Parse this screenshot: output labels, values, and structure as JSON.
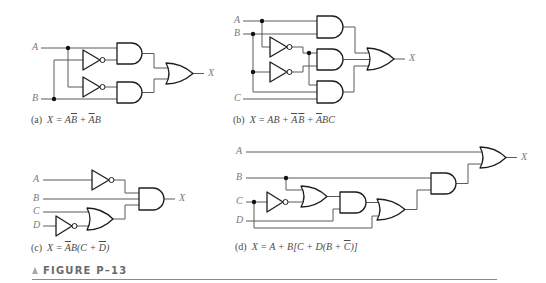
{
  "figure": {
    "label": "FIGURE P–13",
    "colors": {
      "wire": "#5a5a5a",
      "gate_outline": "#1e1e1e",
      "signal_label": "#7a7a7a",
      "caption": "#4a4a4a",
      "figure_label": "#6a6a6a"
    }
  },
  "panels": [
    {
      "id": "a",
      "inputs": [
        "A",
        "B"
      ],
      "output": "X",
      "caption": {
        "tag": "(a)",
        "parts": [
          {
            "t": "X = A",
            "overline": false
          },
          {
            "t": "B",
            "overline": true
          },
          {
            "t": " + ",
            "overline": false
          },
          {
            "t": "A",
            "overline": true
          },
          {
            "t": "B",
            "overline": false
          }
        ]
      }
    },
    {
      "id": "b",
      "inputs": [
        "A",
        "B",
        "C"
      ],
      "output": "X",
      "caption": {
        "tag": "(b)",
        "parts": [
          {
            "t": "X = AB + ",
            "overline": false
          },
          {
            "t": "A",
            "overline": true
          },
          {
            "t": "B",
            "overline": true
          },
          {
            "t": " + ",
            "overline": false
          },
          {
            "t": "A",
            "overline": true
          },
          {
            "t": "BC",
            "overline": false
          }
        ]
      }
    },
    {
      "id": "c",
      "inputs": [
        "A",
        "B",
        "C",
        "D"
      ],
      "output": "X",
      "caption": {
        "tag": "(c)",
        "parts": [
          {
            "t": "X = ",
            "overline": false
          },
          {
            "t": "A",
            "overline": true
          },
          {
            "t": "B(C + ",
            "overline": false
          },
          {
            "t": "D",
            "overline": true
          },
          {
            "t": ")",
            "overline": false
          }
        ]
      }
    },
    {
      "id": "d",
      "inputs": [
        "A",
        "B",
        "C",
        "D"
      ],
      "output": "X",
      "caption": {
        "tag": "(d)",
        "parts": [
          {
            "t": "X = A + B[C + D(B + ",
            "overline": false
          },
          {
            "t": "C",
            "overline": true
          },
          {
            "t": ")]",
            "overline": false
          }
        ]
      }
    }
  ]
}
